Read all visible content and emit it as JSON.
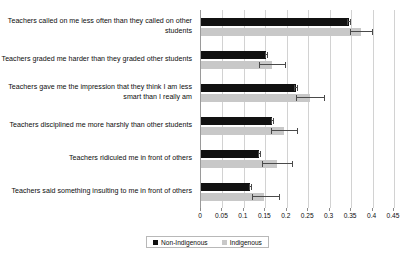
{
  "chart_data": {
    "type": "bar",
    "orientation": "horizontal",
    "title": "",
    "xlabel": "",
    "ylabel": "",
    "xlim": [
      0,
      0.45
    ],
    "grid": true,
    "legend_position": "bottom",
    "categories": [
      "Teachers called on me less often than they called on other students",
      "Teachers graded me harder than they graded other students",
      "Teachers gave me the impression that they think I am less smart than I really am",
      "Teachers disciplined me more harshly than other students",
      "Teachers ridiculed me in front of others",
      "Teachers said something insulting to me in front of others"
    ],
    "tick_labels": [
      "0",
      "0.05",
      "0.1",
      "0.15",
      "0.2",
      "0.25",
      "0.3",
      "0.35",
      "0.4",
      "0.45"
    ],
    "tick_values": [
      0,
      0.05,
      0.1,
      0.15,
      0.2,
      0.25,
      0.3,
      0.35,
      0.4,
      0.45
    ],
    "series": [
      {
        "name": "Non-Indigenous",
        "color": "#111111",
        "values": [
          0.345,
          0.152,
          0.222,
          0.166,
          0.136,
          0.114
        ],
        "error_low": [
          0.341,
          0.149,
          0.218,
          0.163,
          0.133,
          0.111
        ],
        "error_high": [
          0.349,
          0.156,
          0.227,
          0.17,
          0.14,
          0.118
        ]
      },
      {
        "name": "Indigenous",
        "color": "#c8c8c8",
        "values": [
          0.372,
          0.166,
          0.254,
          0.193,
          0.177,
          0.148
        ],
        "error_low": [
          0.348,
          0.135,
          0.222,
          0.163,
          0.143,
          0.118
        ],
        "error_high": [
          0.4,
          0.199,
          0.29,
          0.226,
          0.215,
          0.185
        ]
      }
    ]
  },
  "legend": {
    "entries": [
      {
        "label": "Non-Indigenous",
        "color": "#111111"
      },
      {
        "label": "Indigenous",
        "color": "#c8c8c8"
      }
    ]
  }
}
